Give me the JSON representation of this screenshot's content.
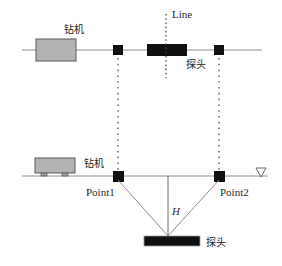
{
  "diagram": {
    "title_text": "Line",
    "background_color": "#ffffff",
    "line_color": "#8a8a8a",
    "marker_color": "#111111",
    "rig_fill_color": "#b3b3b3",
    "rig_stroke_color": "#555555",
    "probe_fill_color": "#101010",
    "dotted_color": "#4a4a4a"
  },
  "top_view": {
    "rig_label": "钻机",
    "line_label": "Line",
    "probe_label": "探头",
    "ground_line_label": "survey-line",
    "marker_left_label": "Point1 projection",
    "marker_right_label": "Point2 projection"
  },
  "bottom_view": {
    "rig_label": "钻机",
    "point1_label": "Point1",
    "point2_label": "Point2",
    "depth_label": "H",
    "probe_label": "探头",
    "datum_label": "datum-triangle"
  }
}
